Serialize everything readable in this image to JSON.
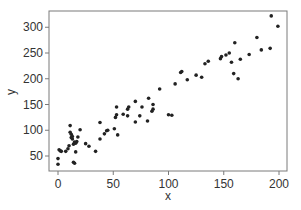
{
  "chart_data": {
    "type": "scatter",
    "title": "",
    "xlabel": "x",
    "ylabel": "y",
    "xlim": [
      -4,
      208
    ],
    "ylim": [
      22,
      330
    ],
    "xticks": [
      0,
      50,
      100,
      150,
      200
    ],
    "yticks": [
      50,
      100,
      150,
      200,
      250,
      300
    ],
    "grid": false,
    "legend": null,
    "point_color": "#222222",
    "series": [
      {
        "name": "points",
        "x": [
          0,
          0,
          1,
          2,
          3,
          7,
          9,
          10,
          11,
          11,
          12,
          12,
          13,
          13,
          14,
          14,
          15,
          15,
          16,
          16,
          17,
          18,
          20,
          25,
          28,
          34,
          38,
          38,
          42,
          44,
          45,
          51,
          52,
          53,
          53,
          54,
          59,
          63,
          63,
          64,
          70,
          70,
          74,
          76,
          81,
          82,
          85,
          86,
          86,
          92,
          100,
          103,
          106,
          111,
          112,
          117,
          125,
          130,
          133,
          136,
          147,
          148,
          152,
          155,
          157,
          159,
          160,
          163,
          165,
          173,
          180,
          184,
          192,
          193,
          199
        ],
        "y": [
          34,
          45,
          62,
          60,
          59,
          59,
          64,
          70,
          96,
          109,
          86,
          92,
          83,
          88,
          38,
          73,
          77,
          36,
          75,
          58,
          78,
          87,
          101,
          74,
          69,
          59,
          83,
          115,
          93,
          99,
          100,
          103,
          125,
          130,
          145,
          91,
          131,
          128,
          141,
          145,
          116,
          156,
          128,
          145,
          118,
          162,
          137,
          141,
          150,
          180,
          130,
          129,
          190,
          212,
          214,
          198,
          207,
          203,
          229,
          234,
          239,
          243,
          246,
          250,
          232,
          210,
          270,
          200,
          238,
          247,
          280,
          256,
          259,
          322,
          302
        ]
      }
    ]
  }
}
